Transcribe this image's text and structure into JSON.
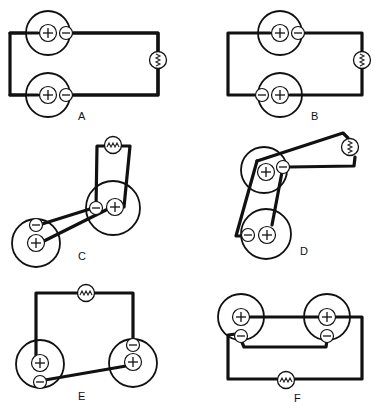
{
  "figure": {
    "panels": [
      {
        "id": "A",
        "label": "A",
        "arrangement": "cells side-by-side, + to left wire, − to right wire (parallel)"
      },
      {
        "id": "B",
        "label": "B",
        "arrangement": "top cell + left/− right, bottom cell reversed − left/+ right"
      },
      {
        "id": "C",
        "label": "C",
        "arrangement": "two cells with crossed leads and lamp above right cell"
      },
      {
        "id": "D",
        "label": "D",
        "arrangement": "two stacked cells with lamp off to upper right"
      },
      {
        "id": "E",
        "label": "E",
        "arrangement": "lamp across top, − of left cell to + of right cell (series)"
      },
      {
        "id": "F",
        "label": "F",
        "arrangement": "+ to + and − to −, lamp below (parallel)"
      }
    ],
    "symbols": {
      "positive": "+",
      "negative": "−",
      "lamp": "zigzag-filament bulb"
    }
  }
}
